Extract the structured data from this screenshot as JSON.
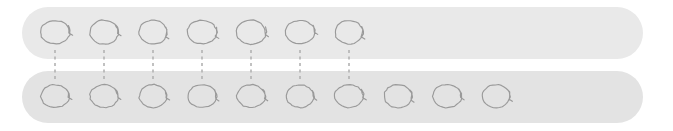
{
  "diagram": {
    "canvas": {
      "width": 673,
      "height": 131,
      "background": "#ffffff"
    },
    "colors": {
      "top_bar_fill": "#e9e9e9",
      "bottom_bar_fill": "#e3e3e3",
      "glyph_stroke": "#9a9a9a",
      "link_stroke": "#b2b2b2"
    },
    "rows": [
      {
        "id": "top-row",
        "label": "top-sequence-bar",
        "bar": {
          "x": 22,
          "y": 7,
          "width": 621,
          "height": 52,
          "corner_radius": 26
        },
        "glyph_count": 7,
        "glyph_start_x": 55,
        "glyph_spacing": 49,
        "glyph_center_y": 33,
        "glyph_name": "hand-drawn-loop"
      },
      {
        "id": "bottom-row",
        "label": "bottom-sequence-bar",
        "bar": {
          "x": 22,
          "y": 71,
          "width": 621,
          "height": 52,
          "corner_radius": 26
        },
        "glyph_count": 10,
        "glyph_start_x": 55,
        "glyph_spacing": 49,
        "glyph_center_y": 97,
        "glyph_name": "hand-drawn-loop"
      }
    ],
    "links": {
      "label": "dashed-correspondence-lines",
      "count": 7,
      "start_x": 55,
      "spacing": 49,
      "y_from": 50,
      "y_to": 80,
      "style": "dashed"
    }
  }
}
